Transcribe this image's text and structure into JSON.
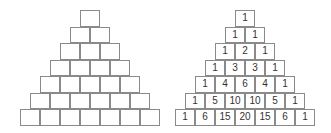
{
  "diagram": {
    "left_pyramid": {
      "label": "empty",
      "rows": [
        [
          "",
          ""
        ],
        [
          "",
          ""
        ],
        [
          "",
          "",
          ""
        ],
        [
          "",
          "",
          "",
          ""
        ],
        [
          "",
          "",
          "",
          "",
          ""
        ],
        [
          "",
          "",
          "",
          "",
          "",
          ""
        ],
        [
          "",
          "",
          "",
          "",
          "",
          "",
          ""
        ]
      ]
    },
    "right_pyramid": {
      "label": "filled",
      "rows": [
        [
          "1"
        ],
        [
          "1",
          "1"
        ],
        [
          "1",
          "2",
          "1"
        ],
        [
          "1",
          "3",
          "3",
          "1"
        ],
        [
          "1",
          "4",
          "6",
          "4",
          "1"
        ],
        [
          "1",
          "5",
          "10",
          "10",
          "5",
          "1"
        ],
        [
          "1",
          "6",
          "15",
          "20",
          "15",
          "6",
          "1"
        ]
      ]
    }
  }
}
